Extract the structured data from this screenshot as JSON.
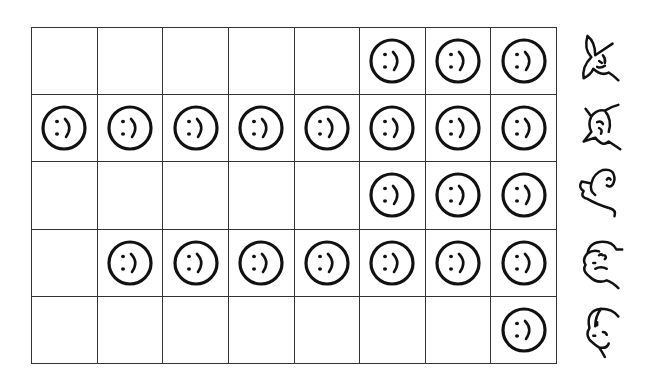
{
  "chart_data": {
    "type": "table",
    "title": "",
    "columns": 8,
    "rows": 5,
    "categories": [
      "rabbit",
      "cat",
      "dog",
      "man-with-cap",
      "boy"
    ],
    "values": [
      3,
      8,
      3,
      7,
      1
    ],
    "symbol": "smiley-face",
    "fill_direction": "right-to-left"
  },
  "grid": {
    "rows": [
      {
        "label": "rabbit",
        "icon": "rabbit-icon",
        "count": 3
      },
      {
        "label": "cat",
        "icon": "cat-icon",
        "count": 8
      },
      {
        "label": "dog",
        "icon": "dog-icon",
        "count": 3
      },
      {
        "label": "man-with-cap",
        "icon": "man-cap-icon",
        "count": 7
      },
      {
        "label": "boy",
        "icon": "boy-icon",
        "count": 1
      }
    ],
    "columns": 8
  },
  "colors": {
    "line": "#333333",
    "ink": "#111111",
    "background": "#ffffff"
  }
}
